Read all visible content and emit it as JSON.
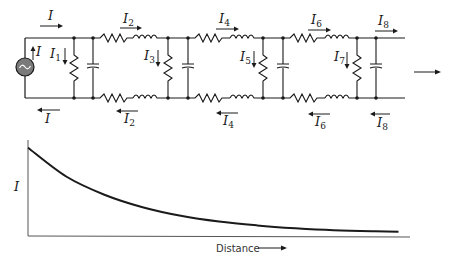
{
  "circuit": {
    "source": {
      "symbol": "~",
      "label": "I",
      "fill": "#7a7a7a"
    },
    "top_currents": [
      {
        "main": "I",
        "sub": ""
      },
      {
        "main": "I",
        "sub": "2"
      },
      {
        "main": "I",
        "sub": "4"
      },
      {
        "main": "I",
        "sub": "6"
      },
      {
        "main": "I",
        "sub": "8"
      }
    ],
    "bottom_currents": [
      {
        "main": "I",
        "sub": ""
      },
      {
        "main": "I",
        "sub": "2"
      },
      {
        "main": "I",
        "sub": "4"
      },
      {
        "main": "I",
        "sub": "6"
      },
      {
        "main": "I",
        "sub": "8"
      }
    ],
    "shunt_currents": [
      {
        "main": "I",
        "sub": "1"
      },
      {
        "main": "I",
        "sub": "3"
      },
      {
        "main": "I",
        "sub": "5"
      },
      {
        "main": "I",
        "sub": "7"
      }
    ],
    "sections": 4,
    "direction": "right"
  },
  "graph": {
    "ylabel": "I",
    "xlabel": "Distance",
    "type": "exponential-decay"
  },
  "chart_data": {
    "type": "line",
    "title": "",
    "xlabel": "Distance",
    "ylabel": "I",
    "xlim": [
      0,
      1
    ],
    "ylim": [
      0,
      1
    ],
    "grid": false,
    "series": [
      {
        "name": "current",
        "x": [
          0,
          0.1,
          0.2,
          0.3,
          0.4,
          0.5,
          0.6,
          0.7,
          0.8,
          0.9,
          0.97
        ],
        "y": [
          0.92,
          0.62,
          0.43,
          0.3,
          0.21,
          0.15,
          0.11,
          0.08,
          0.06,
          0.05,
          0.045
        ]
      }
    ]
  }
}
